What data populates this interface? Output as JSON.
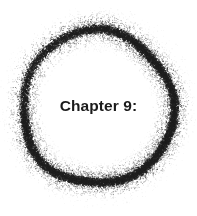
{
  "page": {
    "width": 197,
    "height": 216,
    "background_color": "#ffffff"
  },
  "heading": {
    "text": "Chapter 9:",
    "color": "#1b1b1b",
    "font_size_px": 15.5,
    "weight": "bold"
  },
  "decoration": {
    "name": "spray-paint-ring",
    "shape": "circle",
    "center_x": 97,
    "center_y": 107,
    "radius": 76,
    "core_thickness": 5,
    "scatter_spread": 16,
    "dot_color": "#1f1f1f",
    "dot_count": 16000,
    "seed": 20249
  }
}
